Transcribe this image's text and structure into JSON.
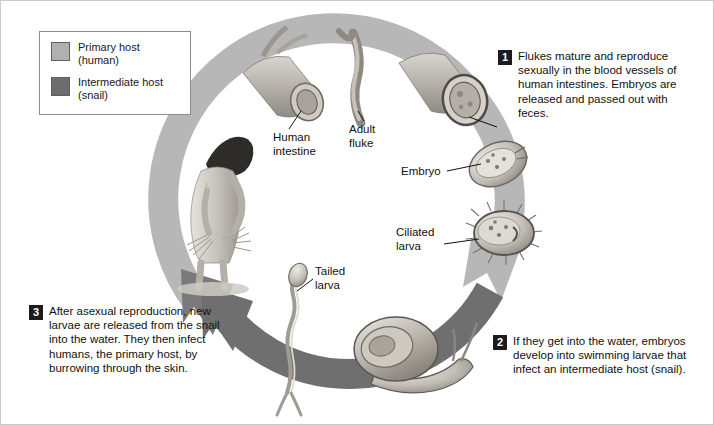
{
  "figure": {
    "colors": {
      "primary_host_band": "#b7b7b7",
      "intermediate_host_band": "#6f6f6f",
      "badge_background": "#1c1c1c",
      "badge_text": "#ffffff",
      "text": "#111111",
      "frame_border": "#c9c9c9"
    }
  },
  "legend": {
    "items": [
      {
        "swatch_color": "#b0b0b0",
        "label": "Primary host",
        "sublabel": "(human)",
        "icon": "legend-swatch-primary-host"
      },
      {
        "swatch_color": "#6d6d6d",
        "label": "Intermediate host",
        "sublabel": "(snail)",
        "icon": "legend-swatch-intermediate-host"
      }
    ]
  },
  "steps": [
    {
      "number": "1",
      "text": "Flukes mature and reproduce sexually in the blood vessels of human intestines. Embryos are released and passed out with feces."
    },
    {
      "number": "2",
      "text": "If they get into the water, embryos develop into swimming larvae that infect an intermediate host (snail)."
    },
    {
      "number": "3",
      "text": "After asexual reproduction, new larvae are released from the snail into the water. They then infect humans, the primary host, by burrowing through the skin."
    }
  ],
  "callouts": [
    {
      "id": "human-intestine",
      "line1": "Human",
      "line2": "intestine"
    },
    {
      "id": "adult-fluke",
      "line1": "Adult",
      "line2": "fluke"
    },
    {
      "id": "embryo",
      "line1": "Embryo",
      "line2": ""
    },
    {
      "id": "ciliated-larva",
      "line1": "Ciliated",
      "line2": "larva"
    },
    {
      "id": "tailed-larva",
      "line1": "Tailed",
      "line2": "larva"
    }
  ],
  "illustrations": [
    {
      "name": "human-figure-in-water",
      "description": "Person bending over working in shallow water"
    },
    {
      "name": "human-intestine-segment",
      "description": "Cutaway tube of human intestine"
    },
    {
      "name": "adult-fluke",
      "description": "Elongated worm-like adult fluke"
    },
    {
      "name": "embryo",
      "description": "Oval embryo with internal speckles"
    },
    {
      "name": "ciliated-larva",
      "description": "Oval larva fringed with cilia"
    },
    {
      "name": "snail",
      "description": "Spiral-shelled snail with tentacles"
    },
    {
      "name": "tailed-larva",
      "description": "Slender larva with forked tail"
    }
  ]
}
